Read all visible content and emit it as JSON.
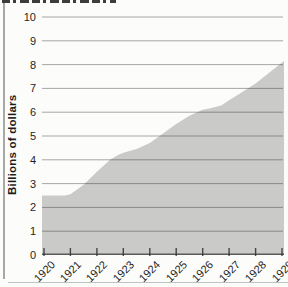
{
  "figure": {
    "background": "#fcfcfa",
    "left_border_color": "#a8a8a6",
    "bottom_rule_color": "#c2c2c0"
  },
  "chart_data": {
    "type": "area",
    "title": "",
    "subtitle": "",
    "ylabel": "Billions of dollars",
    "xlabel": "",
    "categories": [
      1920,
      1921,
      1922,
      1923,
      1924,
      1925,
      1926,
      1927,
      1928,
      1929
    ],
    "values": [
      2.5,
      2.5,
      3.5,
      4.3,
      4.7,
      5.5,
      6.1,
      6.5,
      7.2,
      8.1
    ],
    "ylim": [
      0,
      10
    ],
    "y_ticks": [
      0,
      1,
      2,
      3,
      4,
      5,
      6,
      7,
      8,
      9,
      10
    ],
    "x_tick_labels": [
      "1920",
      "1921",
      "1922",
      "1923",
      "1924",
      "1925",
      "1926",
      "1927",
      "1928",
      "1929"
    ],
    "x_label_rotation_deg": -45,
    "grid": true,
    "legend_position": "none",
    "curve_points": [
      [
        1919.9,
        2.5
      ],
      [
        1920.8,
        2.5
      ],
      [
        1921.0,
        2.55
      ],
      [
        1921.5,
        2.95
      ],
      [
        1922.0,
        3.5
      ],
      [
        1922.5,
        4.0
      ],
      [
        1922.8,
        4.2
      ],
      [
        1923.0,
        4.3
      ],
      [
        1923.5,
        4.45
      ],
      [
        1924.0,
        4.7
      ],
      [
        1924.5,
        5.1
      ],
      [
        1925.0,
        5.5
      ],
      [
        1925.5,
        5.85
      ],
      [
        1926.0,
        6.1
      ],
      [
        1926.3,
        6.17
      ],
      [
        1926.7,
        6.28
      ],
      [
        1927.0,
        6.5
      ],
      [
        1927.5,
        6.85
      ],
      [
        1928.0,
        7.2
      ],
      [
        1928.5,
        7.65
      ],
      [
        1929.1,
        8.15
      ]
    ],
    "colors": {
      "area_fill": "#cacac8",
      "gridline": "#2f2f2f",
      "baseline": "#2f2f2f",
      "tick": "#2f2f2f",
      "label_text": "#1f1f1f"
    }
  }
}
